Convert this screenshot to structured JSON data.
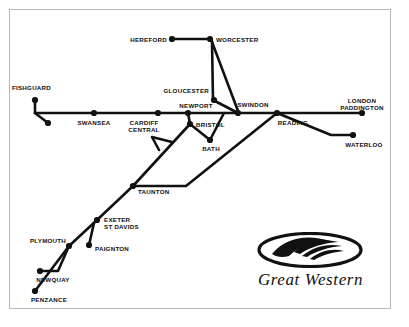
{
  "map": {
    "title": "Great Western railway network map",
    "brand": {
      "name": "Great Western",
      "logo_icon": "great-western-swoosh-logo"
    },
    "style": {
      "line_color": "#111111",
      "dot_color": "#111111",
      "background": "#ffffff",
      "border_color": "#b8b8b8",
      "line_width": 2.6,
      "dot_radius": 3.1
    },
    "stations": [
      {
        "id": "hereford",
        "label": "HEREFORD",
        "x": 172,
        "y": 39,
        "align": "left",
        "lx": 167,
        "ly": 36
      },
      {
        "id": "worcester",
        "label": "WORCESTER",
        "x": 210,
        "y": 39,
        "align": "right",
        "lx": 216,
        "ly": 36
      },
      {
        "id": "gloucester",
        "label": "GLOUCESTER",
        "x": 214,
        "y": 100,
        "align": "left",
        "lx": 209,
        "ly": 87
      },
      {
        "id": "fishguard",
        "label": "FISHGUARD",
        "x": 35,
        "y": 100,
        "align": "left",
        "lx": 51,
        "ly": 84
      },
      {
        "id": "fishguard-branch",
        "label": "",
        "x": 48,
        "y": 123,
        "align": "right",
        "lx": 0,
        "ly": 0
      },
      {
        "id": "swansea",
        "label": "SWANSEA",
        "x": 94,
        "y": 113,
        "align": "center",
        "lx": 94,
        "ly": 119
      },
      {
        "id": "cardiff",
        "label": "CARDIFF\nCENTRAL",
        "x": 158,
        "y": 113,
        "align": "center",
        "lx": 144,
        "ly": 119
      },
      {
        "id": "newport",
        "label": "NEWPORT",
        "x": 188,
        "y": 113,
        "align": "center",
        "lx": 196,
        "ly": 102
      },
      {
        "id": "bristol",
        "label": "BRISTOL",
        "x": 190,
        "y": 124,
        "align": "right",
        "lx": 196,
        "ly": 121
      },
      {
        "id": "bath",
        "label": "BATH",
        "x": 210,
        "y": 140,
        "align": "center",
        "lx": 211,
        "ly": 145
      },
      {
        "id": "swindon",
        "label": "SWINDON",
        "x": 238,
        "y": 113,
        "align": "center",
        "lx": 253,
        "ly": 101
      },
      {
        "id": "reading",
        "label": "READING",
        "x": 277,
        "y": 113,
        "align": "center",
        "lx": 293,
        "ly": 119
      },
      {
        "id": "paddington",
        "label": "LONDON\nPADDINGTON",
        "x": 362,
        "y": 113,
        "align": "center",
        "lx": 362,
        "ly": 97
      },
      {
        "id": "waterloo",
        "label": "WATERLOO",
        "x": 353,
        "y": 135,
        "align": "center",
        "lx": 364,
        "ly": 141
      },
      {
        "id": "taunton",
        "label": "TAUNTON",
        "x": 133,
        "y": 186,
        "align": "right",
        "lx": 138,
        "ly": 188
      },
      {
        "id": "exeter",
        "label": "EXETER\nST DAVIDS",
        "x": 97,
        "y": 220,
        "align": "right",
        "lx": 104,
        "ly": 216
      },
      {
        "id": "paignton",
        "label": "PAIGNTON",
        "x": 89,
        "y": 245,
        "align": "right",
        "lx": 95,
        "ly": 245
      },
      {
        "id": "plymouth",
        "label": "PLYMOUTH",
        "x": 69,
        "y": 246,
        "align": "center",
        "lx": 48,
        "ly": 237
      },
      {
        "id": "newquay",
        "label": "NEWQUAY",
        "x": 40,
        "y": 271,
        "align": "center",
        "lx": 53,
        "ly": 276
      },
      {
        "id": "penzance",
        "label": "PENZANCE",
        "x": 35,
        "y": 291,
        "align": "center",
        "lx": 49,
        "ly": 296
      }
    ],
    "routes": [
      {
        "id": "hereford-worcester",
        "points": "172,39 210,39"
      },
      {
        "id": "worcester-gloucester",
        "points": "212,41 213,100"
      },
      {
        "id": "worcester-swindon",
        "points": "212,42 238,111"
      },
      {
        "id": "gloucester-swindon",
        "points": "213,100 238,113"
      },
      {
        "id": "fishguard-main",
        "points": "35,100 35,113"
      },
      {
        "id": "fishguard-branch",
        "points": "35,113 48,123"
      },
      {
        "id": "main-line-west",
        "points": "35,113 362,113"
      },
      {
        "id": "newport-bristol",
        "points": "188,113 190,124"
      },
      {
        "id": "bristol-bath",
        "points": "190,124 210,140"
      },
      {
        "id": "bath-swindon",
        "points": "210,140 224,113"
      },
      {
        "id": "bristol-taunton",
        "points": "190,124 133,186"
      },
      {
        "id": "severn-loop",
        "points": "172,142 152,137 159,150"
      },
      {
        "id": "taunton-reading",
        "points": "133,186 186,186 277,113"
      },
      {
        "id": "taunton-exeter",
        "points": "133,186 97,220"
      },
      {
        "id": "exeter-paignton",
        "points": "94,223 89,245"
      },
      {
        "id": "exeter-plymouth",
        "points": "97,220 69,246"
      },
      {
        "id": "plymouth-newquay",
        "points": "69,246 58,271 40,271"
      },
      {
        "id": "plymouth-penzance",
        "points": "69,246 35,291"
      },
      {
        "id": "reading-waterloo",
        "points": "277,113 331,135 353,135"
      }
    ]
  }
}
